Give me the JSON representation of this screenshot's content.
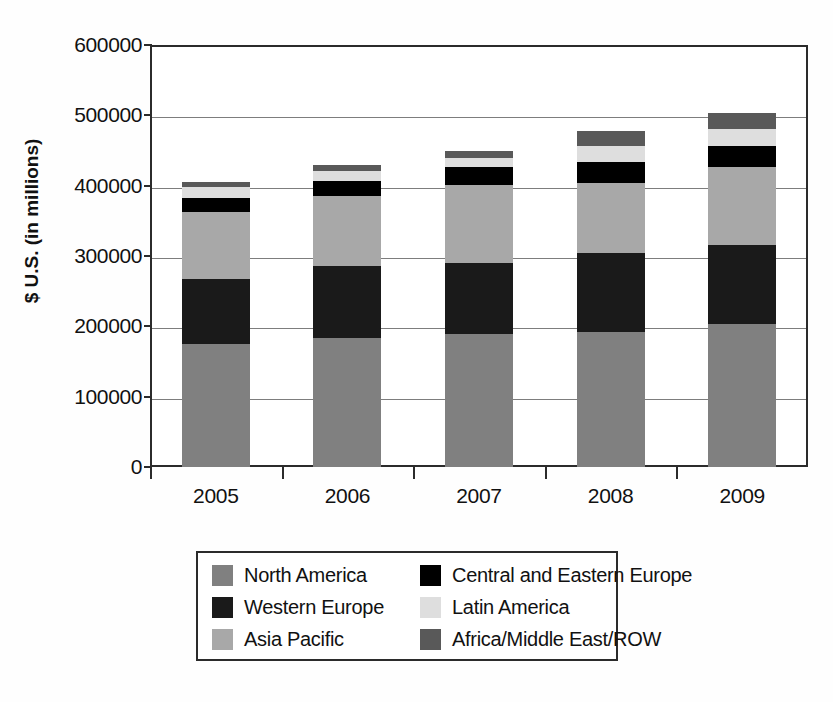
{
  "chart_data": {
    "type": "bar",
    "stacked": true,
    "title": "",
    "xlabel": "",
    "ylabel": "$ U.S. (in millions)",
    "categories": [
      "2005",
      "2006",
      "2007",
      "2008",
      "2009"
    ],
    "ylim": [
      0,
      600000
    ],
    "yticks": [
      0,
      100000,
      200000,
      300000,
      400000,
      500000,
      600000
    ],
    "ytick_labels": [
      "0",
      "100000",
      "200000",
      "300000",
      "400000",
      "500000",
      "600000"
    ],
    "grid": true,
    "legend_position": "bottom",
    "series": [
      {
        "name": "North America",
        "color": "#808080",
        "values": [
          175000,
          183000,
          189000,
          192000,
          203000
        ]
      },
      {
        "name": "Western Europe",
        "color": "#1a1a1a",
        "values": [
          92000,
          103000,
          101000,
          112000,
          113000
        ]
      },
      {
        "name": "Asia Pacific",
        "color": "#a8a8a8",
        "values": [
          95000,
          100000,
          111000,
          100000,
          110000
        ]
      },
      {
        "name": "Central and Eastern Europe",
        "color": "#000000",
        "values": [
          21000,
          21000,
          25000,
          30000,
          31000
        ]
      },
      {
        "name": "Latin America",
        "color": "#dedede",
        "values": [
          15000,
          14000,
          14000,
          23000,
          24000
        ]
      },
      {
        "name": "Africa/Middle East/ROW",
        "color": "#595959",
        "values": [
          7000,
          9000,
          10000,
          21000,
          22000
        ]
      }
    ],
    "totals": [
      405000,
      430000,
      450000,
      478000,
      503000
    ]
  },
  "legend": {
    "entries": [
      {
        "label": "North America",
        "color": "#808080"
      },
      {
        "label": "Central and Eastern Europe",
        "color": "#000000"
      },
      {
        "label": "Western Europe",
        "color": "#1a1a1a"
      },
      {
        "label": "Latin America",
        "color": "#dedede"
      },
      {
        "label": "Asia Pacific",
        "color": "#a8a8a8"
      },
      {
        "label": "Africa/Middle East/ROW",
        "color": "#595959"
      }
    ]
  }
}
